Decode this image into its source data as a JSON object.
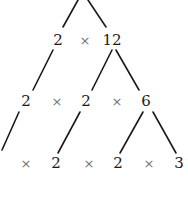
{
  "title_fragment": "",
  "colors": {
    "line": "#1a1a1a",
    "number": "#1a1a1a",
    "operator": "#777777",
    "background": "#ffffff"
  },
  "rows": [
    {
      "items": [
        {
          "type": "number",
          "text": "2",
          "x": 58,
          "y": 40
        },
        {
          "type": "operator",
          "text": "×",
          "x": 85,
          "y": 40
        },
        {
          "type": "number",
          "text": "12",
          "x": 112,
          "y": 40
        }
      ]
    },
    {
      "items": [
        {
          "type": "number",
          "text": "2",
          "x": 26,
          "y": 101
        },
        {
          "type": "operator",
          "text": "×",
          "x": 57,
          "y": 101
        },
        {
          "type": "number",
          "text": "2",
          "x": 86,
          "y": 101
        },
        {
          "type": "operator",
          "text": "×",
          "x": 117,
          "y": 101
        },
        {
          "type": "number",
          "text": "6",
          "x": 146,
          "y": 101
        }
      ]
    },
    {
      "items": [
        {
          "type": "operator",
          "text": "×",
          "x": 26,
          "y": 163
        },
        {
          "type": "number",
          "text": "2",
          "x": 56,
          "y": 163
        },
        {
          "type": "operator",
          "text": "×",
          "x": 89,
          "y": 163
        },
        {
          "type": "number",
          "text": "2",
          "x": 118,
          "y": 163
        },
        {
          "type": "operator",
          "text": "×",
          "x": 149,
          "y": 163
        },
        {
          "type": "number",
          "text": "3",
          "x": 179,
          "y": 163
        }
      ]
    }
  ],
  "branches": [
    {
      "x1": 78,
      "y1": 0,
      "x2": 63,
      "y2": 27
    },
    {
      "x1": 88,
      "y1": 0,
      "x2": 106,
      "y2": 27
    },
    {
      "x1": 53,
      "y1": 50,
      "x2": 33,
      "y2": 90
    },
    {
      "x1": 112,
      "y1": 50,
      "x2": 92,
      "y2": 90
    },
    {
      "x1": 116,
      "y1": 50,
      "x2": 139,
      "y2": 90
    },
    {
      "x1": 19,
      "y1": 112,
      "x2": 2,
      "y2": 150
    },
    {
      "x1": 80,
      "y1": 112,
      "x2": 58,
      "y2": 153
    },
    {
      "x1": 143,
      "y1": 112,
      "x2": 120,
      "y2": 153
    },
    {
      "x1": 153,
      "y1": 112,
      "x2": 176,
      "y2": 153
    }
  ]
}
